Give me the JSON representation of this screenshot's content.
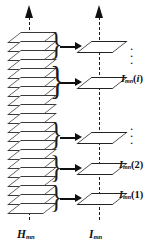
{
  "figure": {
    "type": "schematic-diagram",
    "background_color": "#ffffff",
    "ink_color": "#111111",
    "left_axis": {
      "label_base": "H",
      "label_sub": "mn",
      "name": "H_mn",
      "plane_count": 20,
      "arrow_direction": "up",
      "line_style": "dashed"
    },
    "right_axis": {
      "label_base": "I",
      "label_sub": "mn",
      "name": "I_mn",
      "plane_count": 5,
      "arrow_direction": "up",
      "line_style": "dashed"
    },
    "groups": [
      {
        "id": "g-top",
        "brace": "}",
        "arrow": "→",
        "result_label": {
          "base": "",
          "sub": "",
          "arg": "",
          "is_ellipsis": true,
          "text": "⋮"
        }
      },
      {
        "id": "g-i",
        "brace": "}",
        "arrow": "→",
        "result_label": {
          "base": "I",
          "sub": "mn",
          "arg": "i",
          "arg_italic": true,
          "is_ellipsis": false,
          "text": "I_mn(i)"
        }
      },
      {
        "id": "g-mid",
        "brace": "}",
        "arrow": "→",
        "result_label": {
          "base": "",
          "sub": "",
          "arg": "",
          "is_ellipsis": true,
          "text": "⋮"
        }
      },
      {
        "id": "g-2",
        "brace": "}",
        "arrow": "→",
        "result_label": {
          "base": "I",
          "sub": "mn",
          "arg": "2",
          "arg_italic": false,
          "is_ellipsis": false,
          "text": "I_mn(2)"
        }
      },
      {
        "id": "g-1",
        "brace": "}",
        "arrow": "→",
        "result_label": {
          "base": "I",
          "sub": "mn",
          "arg": "1",
          "arg_italic": false,
          "is_ellipsis": false,
          "text": "I_mn(1)"
        }
      }
    ],
    "paren_open": "(",
    "paren_close": ")"
  }
}
